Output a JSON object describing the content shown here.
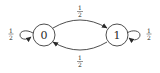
{
  "diagram": {
    "type": "markov-chain-state-diagram",
    "states": [
      {
        "id": "0",
        "label": "0"
      },
      {
        "id": "1",
        "label": "1"
      }
    ],
    "transitions": [
      {
        "from": "0",
        "to": "0",
        "prob_num": "1",
        "prob_den": "2"
      },
      {
        "from": "0",
        "to": "1",
        "prob_num": "1",
        "prob_den": "2"
      },
      {
        "from": "1",
        "to": "0",
        "prob_num": "1",
        "prob_den": "2"
      },
      {
        "from": "1",
        "to": "1",
        "prob_num": "1",
        "prob_den": "2"
      }
    ],
    "colors": {
      "stroke": "#3a3a3a",
      "text": "#2a2a2a",
      "background": "#ffffff"
    }
  }
}
